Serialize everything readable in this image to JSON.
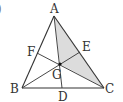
{
  "figure": {
    "type": "triangle-with-medians",
    "partial_glyph": ")",
    "colors": {
      "line": "#333333",
      "shade": "#dcdcdc",
      "label": "#333333",
      "centroid": "#111111"
    },
    "points": {
      "A": {
        "label": "A",
        "x": 54,
        "y": 16
      },
      "B": {
        "label": "B",
        "x": 22,
        "y": 88
      },
      "C": {
        "label": "C",
        "x": 104,
        "y": 88
      },
      "D": {
        "label": "D",
        "x": 62,
        "y": 88
      },
      "E": {
        "label": "E",
        "x": 80,
        "y": 52
      },
      "F": {
        "label": "F",
        "x": 37,
        "y": 53
      },
      "G": {
        "label": "G",
        "x": 60,
        "y": 64
      }
    },
    "shaded_region": [
      "A",
      "E",
      "C",
      "G"
    ],
    "segments": [
      [
        "A",
        "B"
      ],
      [
        "B",
        "C"
      ],
      [
        "C",
        "A"
      ],
      [
        "A",
        "D"
      ],
      [
        "B",
        "E"
      ],
      [
        "C",
        "F"
      ]
    ]
  }
}
